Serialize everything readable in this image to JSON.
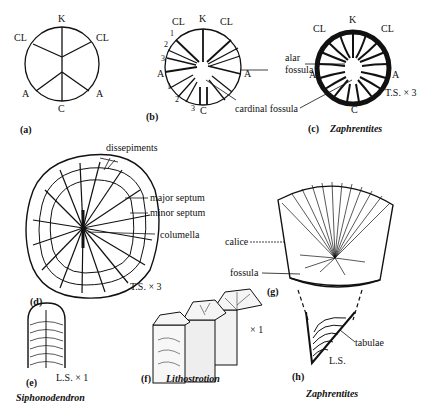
{
  "figure": {
    "a": {
      "label": "(a)",
      "positions": {
        "top": "K",
        "upper_left": "CL",
        "upper_right": "CL",
        "lower_left": "A",
        "lower_right": "A",
        "bottom": "C"
      }
    },
    "b": {
      "label": "(b)",
      "positions": {
        "top": "K",
        "upper_left": "CL",
        "upper_right": "CL",
        "left": "A",
        "right": "A",
        "bottom": "C"
      },
      "numbers_upper": [
        "1",
        "2",
        "3"
      ],
      "numbers_lower": [
        "1",
        "2",
        "3"
      ],
      "annotations": {
        "alar_fossula": "alar fossula",
        "cardinal_fossula": "cardinal fossula"
      }
    },
    "c": {
      "label": "(c)",
      "genus": "Zaphrentites",
      "section": "T.S. × 3",
      "positions": {
        "top": "K",
        "upper_left": "CL",
        "upper_right": "CL",
        "left": "A",
        "right": "A",
        "bottom": "C"
      }
    },
    "d": {
      "label": "(d)",
      "section": "T.S. × 3",
      "annotations": [
        "dissepiments",
        "major septum",
        "minor septum",
        "columella"
      ]
    },
    "e": {
      "label": "(e)",
      "section": "L.S. × 1",
      "genus": "Siphonodendron"
    },
    "f": {
      "label": "(f)",
      "genus": "Lithostrotion",
      "scale": "× 1"
    },
    "g": {
      "label": "(g)",
      "annotations": [
        "calice",
        "fossula"
      ]
    },
    "h": {
      "label": "(h)",
      "genus": "Zaphrentites",
      "section": "L.S.",
      "annotations": [
        "tabulae"
      ]
    }
  }
}
